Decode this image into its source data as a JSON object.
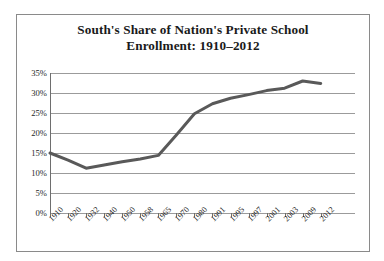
{
  "chart_data": {
    "type": "line",
    "title": "South's Share of Nation's Private School Enrollment: 1910–2012",
    "title_lines": [
      "South's Share of Nation's Private School",
      "Enrollment: 1910–2012"
    ],
    "xlabel": "",
    "ylabel": "",
    "categories": [
      "1910",
      "1920",
      "1932",
      "1940",
      "1950",
      "1958",
      "1965",
      "1970",
      "1980",
      "1991",
      "1995",
      "1997",
      "2001",
      "2003",
      "2009",
      "2012"
    ],
    "values": [
      15.0,
      13.2,
      11.2,
      12.0,
      12.8,
      13.5,
      14.4,
      19.5,
      24.8,
      27.3,
      28.7,
      29.6,
      30.6,
      31.2,
      33.0,
      32.4
    ],
    "ylim": [
      0,
      35
    ],
    "yticks": [
      0,
      5,
      10,
      15,
      20,
      25,
      30,
      35
    ],
    "ytick_labels": [
      "0%",
      "5%",
      "10%",
      "15%",
      "20%",
      "25%",
      "30%",
      "35%"
    ],
    "grid": true,
    "legend": false,
    "legend_position": "none",
    "series_color": "#595959",
    "grid_color": "#9b9b9b",
    "axis_color": "#6e6e6e",
    "border_color": "#8a8a8a",
    "text_color": "#1a1a1a",
    "line_width": 3
  }
}
